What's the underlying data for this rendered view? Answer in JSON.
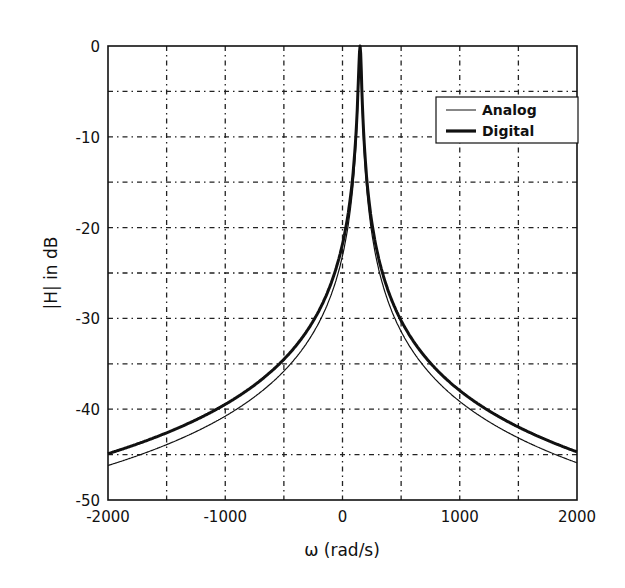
{
  "chart_data": {
    "type": "line",
    "title": "",
    "xlabel": "ω (rad/s)",
    "ylabel": "|H| in dB",
    "xlim": [
      -2000,
      2000
    ],
    "ylim": [
      -50,
      0
    ],
    "xticks": [
      -2000,
      -1000,
      0,
      1000,
      2000
    ],
    "xtick_labels": [
      "-2000",
      "-1000",
      "0",
      "1000",
      "2000"
    ],
    "yticks": [
      0,
      -10,
      -20,
      -30,
      -40,
      -50
    ],
    "ytick_labels": [
      "0",
      "-10",
      "-20",
      "-30",
      "-40",
      "-50"
    ],
    "grid": true,
    "grid_x_step": 500,
    "grid_y_step": 5,
    "legend_position": "upper right",
    "x": [
      -2000,
      -1500,
      -1000,
      -500,
      -250,
      0,
      100,
      150,
      200,
      300,
      500,
      1000,
      1500,
      2000
    ],
    "series": [
      {
        "name": "Analog",
        "line_width": "thin",
        "color": "#111111",
        "values": [
          -46.2,
          -43.8,
          -40.7,
          -35.9,
          -31.6,
          -23.2,
          -10.5,
          0,
          -10.5,
          -19.5,
          -30.8,
          -38.6,
          -42.9,
          -45.9
        ]
      },
      {
        "name": "Digital",
        "line_width": "thick",
        "color": "#111111",
        "values": [
          -44.9,
          -43.0,
          -40.3,
          -35.8,
          -31.6,
          -23.2,
          -10.5,
          0,
          -10.5,
          -19.5,
          -30.8,
          -38.4,
          -42.1,
          -44.7
        ]
      }
    ]
  },
  "legend": {
    "items": [
      "Analog",
      "Digital"
    ]
  }
}
